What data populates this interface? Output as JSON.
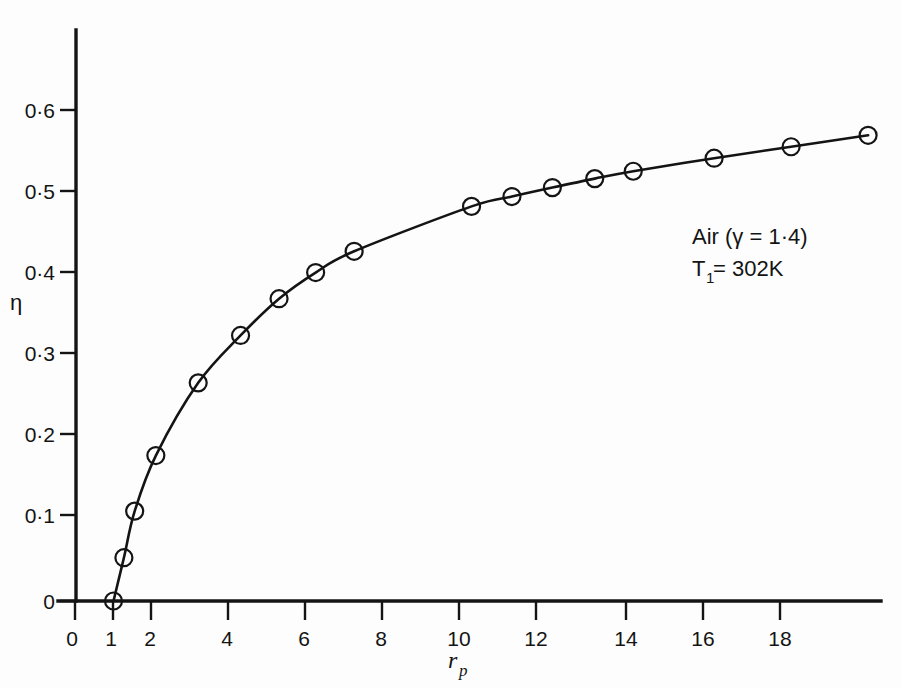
{
  "chart_data": {
    "type": "line",
    "title": "",
    "subtitle": "",
    "xlabel": "r_p",
    "xlabel_base": "r",
    "xlabel_sub": "p",
    "ylabel": "η",
    "xlim": [
      0,
      19.6
    ],
    "ylim": [
      0,
      0.655
    ],
    "grid": false,
    "legend_position": "none",
    "marker": "circle-with-dot",
    "x_ticks": [
      0,
      1,
      2,
      4,
      6,
      8,
      10,
      12,
      14,
      16,
      18
    ],
    "x_tick_labels": [
      "0",
      "1",
      "2",
      "4",
      "6",
      "8",
      "10",
      "12",
      "14",
      "16",
      "18"
    ],
    "y_ticks": [
      0,
      0.1,
      0.2,
      0.3,
      0.4,
      0.5,
      0.6
    ],
    "y_tick_labels": [
      "0",
      "0·0·1",
      "0·2",
      "0·3",
      "0·4",
      "0·5",
      "0·6"
    ],
    "y_tick_labels_display": [
      "0",
      "0·1",
      "0·2",
      "0·3",
      "0·4",
      "0·5",
      "0·6"
    ],
    "x": [
      1.0,
      1.27,
      1.55,
      2.1,
      3.2,
      4.3,
      5.3,
      6.25,
      7.25,
      10.3,
      11.35,
      12.4,
      13.5,
      14.5,
      16.6,
      18.6,
      20.6
    ],
    "y": [
      0.0,
      0.053,
      0.11,
      0.178,
      0.267,
      0.325,
      0.37,
      0.402,
      0.428,
      0.483,
      0.495,
      0.506,
      0.517,
      0.526,
      0.542,
      0.556,
      0.57
    ],
    "series": [
      {
        "name": "Air thermal efficiency",
        "points": [
          [
            1.0,
            0.0
          ],
          [
            1.27,
            0.053
          ],
          [
            1.55,
            0.11
          ],
          [
            2.1,
            0.178
          ],
          [
            3.2,
            0.267
          ],
          [
            4.3,
            0.325
          ],
          [
            5.3,
            0.37
          ],
          [
            6.25,
            0.402
          ],
          [
            7.25,
            0.428
          ],
          [
            10.3,
            0.483
          ],
          [
            11.35,
            0.495
          ],
          [
            12.4,
            0.506
          ],
          [
            13.5,
            0.517
          ],
          [
            14.5,
            0.526
          ],
          [
            16.6,
            0.542
          ],
          [
            18.6,
            0.556
          ],
          [
            20.6,
            0.57
          ]
        ]
      }
    ],
    "annotations": [
      {
        "id": "gas-properties",
        "line1": "Air (γ = 1·4)",
        "line2_base": "T",
        "line2_sub": "1",
        "line2_rest": " = 302K",
        "line2": "T₁ = 302K"
      }
    ],
    "colors": {
      "ink": "#141414",
      "background": "#fdfdfd",
      "curve": "#141414",
      "marker": "#141414"
    }
  }
}
